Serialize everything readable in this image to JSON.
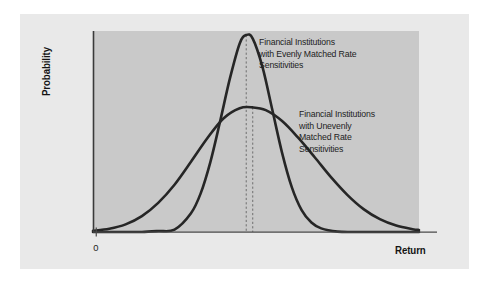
{
  "figure": {
    "background_color": "#e9e9e9",
    "plot_background_color": "#c9c9c9",
    "page_background_color": "#ffffff",
    "curve_color": "#262626",
    "axis_color": "#3a3a3a",
    "guide_line_color": "#6e6e6e"
  },
  "axes": {
    "ylabel": "Probability",
    "xlabel": "Return",
    "origin_tick_label": "0"
  },
  "annotations": {
    "narrow_curve_label": "Financial Institutions\nwith Evenly Matched Rate\nSensitivities",
    "wide_curve_label": "Financial Institutions\nwith Unevenly\nMatched Rate\nSensitivities"
  },
  "chart_data": {
    "type": "line",
    "title": "",
    "subtitle": "",
    "xlabel": "Return",
    "ylabel": "Probability",
    "xlim": [
      0,
      100
    ],
    "ylim": [
      0,
      1
    ],
    "grid": false,
    "legend_position": "inline-annotations",
    "x_ticks": [
      {
        "value": 1,
        "label": "0"
      }
    ],
    "y_ticks": [],
    "series": [
      {
        "name": "Financial Institutions with Evenly Matched Rate Sensitivities",
        "shape": "normal-distribution",
        "description": "Tall narrow bell curve, low standard deviation",
        "mean": 47,
        "std_dev": 8.2,
        "peak_height": 0.98,
        "color": "#262626",
        "line_width": 2.6,
        "x": [
          0,
          5,
          10,
          15,
          20,
          25,
          30,
          33,
          36,
          39,
          42,
          45,
          47,
          49,
          52,
          55,
          58,
          61,
          64,
          67,
          70,
          75,
          80,
          85,
          90,
          95,
          100
        ],
        "y": [
          0.0,
          0.0,
          0.0,
          0.0,
          0.005,
          0.012,
          0.092,
          0.191,
          0.348,
          0.551,
          0.764,
          0.938,
          0.98,
          0.962,
          0.82,
          0.608,
          0.394,
          0.222,
          0.109,
          0.047,
          0.018,
          0.002,
          0.0,
          0.0,
          0.0,
          0.0,
          0.0
        ]
      },
      {
        "name": "Financial Institutions with Unevenly Matched Rate Sensitivities",
        "shape": "normal-distribution",
        "description": "Short wide bell curve, high standard deviation",
        "mean": 49,
        "std_dev": 16.5,
        "peak_height": 0.62,
        "color": "#262626",
        "line_width": 2.6,
        "x": [
          0,
          5,
          10,
          15,
          20,
          25,
          30,
          35,
          40,
          45,
          49,
          53,
          58,
          63,
          68,
          73,
          78,
          83,
          88,
          93,
          98,
          100
        ],
        "y": [
          0.006,
          0.016,
          0.038,
          0.079,
          0.145,
          0.235,
          0.348,
          0.465,
          0.565,
          0.616,
          0.62,
          0.606,
          0.552,
          0.468,
          0.372,
          0.273,
          0.185,
          0.114,
          0.064,
          0.032,
          0.014,
          0.01
        ]
      }
    ],
    "guide_lines": [
      {
        "name": "narrow-curve-peak-guide",
        "x": 47,
        "style": "dashed",
        "orientation": "vertical"
      },
      {
        "name": "wide-curve-peak-guide",
        "x": 49,
        "style": "dashed",
        "orientation": "vertical"
      }
    ]
  }
}
